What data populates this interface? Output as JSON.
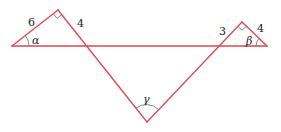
{
  "diagram": {
    "type": "geometry",
    "colors": {
      "line": "#e0454f",
      "angle_mark": "#6f7c8a",
      "text": "#222222",
      "background": "#ffffff"
    },
    "points": {
      "A": [
        12,
        46
      ],
      "B": [
        58,
        10
      ],
      "C": [
        147,
        122
      ],
      "D": [
        242,
        22
      ],
      "E": [
        267,
        46
      ]
    },
    "labels": {
      "side_left_hyp_leg": "6",
      "side_left_leg": "4",
      "side_right_leg_a": "3",
      "side_right_leg_b": "4",
      "angle_alpha": "α",
      "angle_beta": "β",
      "angle_gamma": "γ"
    },
    "right_angles": [
      "B",
      "D"
    ]
  }
}
